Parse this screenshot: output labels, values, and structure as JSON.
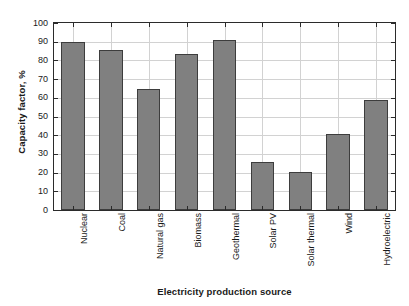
{
  "chart_data": {
    "type": "bar",
    "title": "",
    "xlabel": "Electricity production source",
    "ylabel": "Capacity factor, %",
    "categories": [
      "Nuclear",
      "Coal",
      "Natural gas",
      "Biomass",
      "Geothermal",
      "Solar PV",
      "Solar thermal",
      "Wind",
      "Hydroelectric"
    ],
    "values": [
      90,
      85.5,
      64.5,
      83.5,
      91,
      25.5,
      20.5,
      40.5,
      59
    ],
    "ylim": [
      0,
      100
    ],
    "yticks": [
      0,
      10,
      20,
      30,
      40,
      50,
      60,
      70,
      80,
      90,
      100
    ],
    "ytick_labels": [
      "0",
      "10",
      "20",
      "30",
      "40",
      "50",
      "60",
      "70",
      "80",
      "90",
      "100"
    ],
    "grid": true,
    "legend": false,
    "bar_color": "#808080",
    "bar_edge_color": "#3d3d3d",
    "grid_color": "#d2d2d2",
    "axis_color": "#2b2b2b",
    "background": "#ffffff"
  }
}
